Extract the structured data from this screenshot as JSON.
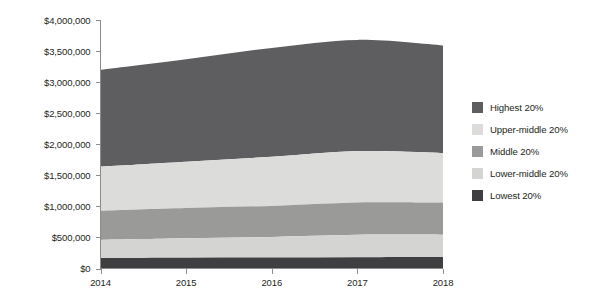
{
  "chart_data": {
    "type": "area",
    "stacked": true,
    "title": "",
    "subtitle": "",
    "xlabel": "",
    "ylabel": "",
    "x": [
      2014,
      2015,
      2016,
      2017,
      2018
    ],
    "categories": [
      "2014",
      "2015",
      "2016",
      "2017",
      "2018"
    ],
    "xtick_labels": [
      "2014",
      "2015",
      "2016",
      "2017",
      "2018"
    ],
    "ytick_labels": [
      "$0",
      "$500,000",
      "$1,000,000",
      "$1,500,000",
      "$2,000,000",
      "$2,500,000",
      "$3,000,000",
      "$3,500,000",
      "$4,000,000"
    ],
    "ytick_values": [
      0,
      500000,
      1000000,
      1500000,
      2000000,
      2500000,
      3000000,
      3500000,
      4000000
    ],
    "ylim": [
      0,
      4000000
    ],
    "xlim": [
      2014,
      2018
    ],
    "grid": false,
    "legend_position": "right",
    "stack_order_bottom_to_top": [
      "Lowest 20%",
      "Lower-middle 20%",
      "Middle 20%",
      "Upper-middle 20%",
      "Highest 20%"
    ],
    "series": [
      {
        "name": "Lowest 20%",
        "color": "#3f3f41",
        "values": [
          170000,
          175000,
          178000,
          182000,
          185000
        ],
        "cumulative_top": [
          170000,
          175000,
          178000,
          182000,
          185000
        ]
      },
      {
        "name": "Lower-middle 20%",
        "color": "#d4d4d2",
        "values": [
          290000,
          310000,
          330000,
          360000,
          360000
        ],
        "cumulative_top": [
          460000,
          485000,
          508000,
          542000,
          545000
        ]
      },
      {
        "name": "Middle 20%",
        "color": "#9a9a99",
        "values": [
          470000,
          490000,
          500000,
          520000,
          515000
        ],
        "cumulative_top": [
          930000,
          975000,
          1008000,
          1062000,
          1060000
        ]
      },
      {
        "name": "Upper-middle 20%",
        "color": "#dcdcda",
        "values": [
          710000,
          745000,
          790000,
          828000,
          800000
        ],
        "cumulative_top": [
          1640000,
          1720000,
          1798000,
          1890000,
          1860000
        ]
      },
      {
        "name": "Highest 20%",
        "color": "#5e5e60",
        "values": [
          1560000,
          1650000,
          1752000,
          1790000,
          1730000
        ],
        "cumulative_top": [
          3200000,
          3370000,
          3550000,
          3680000,
          3590000
        ]
      }
    ],
    "legend_entries": [
      {
        "label": "Highest 20%",
        "color": "#5e5e60"
      },
      {
        "label": "Upper-middle 20%",
        "color": "#dcdcda"
      },
      {
        "label": "Middle 20%",
        "color": "#9a9a99"
      },
      {
        "label": "Lower-middle 20%",
        "color": "#d4d4d2"
      },
      {
        "label": "Lowest 20%",
        "color": "#3f3f41"
      }
    ]
  },
  "axis": {
    "y_labels": [
      "$4,000,000",
      "$3,500,000",
      "$3,000,000",
      "$2,500,000",
      "$2,000,000",
      "$1,500,000",
      "$1,000,000",
      "$500,000",
      "$0"
    ],
    "x_labels": [
      "2014",
      "2015",
      "2016",
      "2017",
      "2018"
    ]
  },
  "colors": {
    "highest": "#5e5e60",
    "upper_middle": "#dcdcda",
    "middle": "#9a9a99",
    "lower_middle": "#d4d4d2",
    "lowest": "#3f3f41",
    "axis": "#8c8c8c",
    "text": "#231f20",
    "background": "#ffffff"
  }
}
